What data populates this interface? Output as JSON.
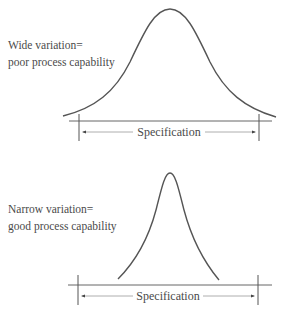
{
  "panels": [
    {
      "id": "wide",
      "label_line1": "Wide variation=",
      "label_line2": "poor process capability",
      "spec_label": "Specification"
    },
    {
      "id": "narrow",
      "label_line1": "Narrow variation=",
      "label_line2": "good process capability",
      "spec_label": "Specification"
    }
  ],
  "colors": {
    "curve": "#555555",
    "baseline": "#666666",
    "arrow": "#888888",
    "text": "#4a4a4a"
  }
}
